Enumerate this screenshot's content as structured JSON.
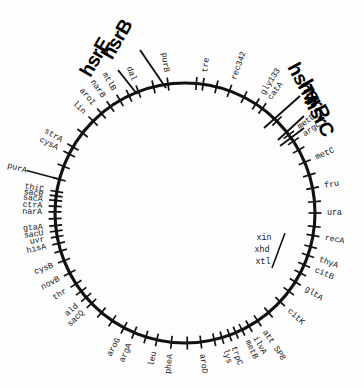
{
  "figure": {
    "type": "circular-genetic-map",
    "background_color": "#ffffff",
    "line_color": "#111111"
  },
  "circle": {
    "center_x": 185,
    "center_y": 213,
    "radius": 130
  },
  "hsr_labels": [
    {
      "id": "hsrB",
      "text": "hsrB",
      "x": 118,
      "y": 40,
      "rotate": -60,
      "leader": {
        "x1": 140,
        "y1": 50,
        "x2": 166,
        "y2": 88
      }
    },
    {
      "id": "hsrE",
      "text": "hsrE",
      "x": 96,
      "y": 58,
      "rotate": -60,
      "leader": {
        "x1": 118,
        "y1": 70,
        "x2": 137,
        "y2": 94
      }
    },
    {
      "id": "hsrM",
      "text": "hsrM",
      "x": 302,
      "y": 84,
      "rotate": 62,
      "leader": {
        "x1": 300,
        "y1": 96,
        "x2": 264,
        "y2": 128
      }
    },
    {
      "id": "hsrR",
      "text": "hsrR",
      "x": 314,
      "y": 100,
      "rotate": 62,
      "leader": {
        "x1": 304,
        "y1": 116,
        "x2": 278,
        "y2": 140
      }
    },
    {
      "id": "hsrC",
      "text": "hsrC",
      "x": 318,
      "y": 117,
      "rotate": 62,
      "leader": {
        "x1": 304,
        "y1": 128,
        "x2": 280,
        "y2": 146
      }
    }
  ],
  "inner_labels": [
    {
      "id": "xin",
      "text": "xin",
      "x": 264,
      "y": 238,
      "rotate": 0
    },
    {
      "id": "xhd",
      "text": "xhd",
      "x": 262,
      "y": 250,
      "rotate": 0
    },
    {
      "id": "xtl",
      "text": "xtl",
      "x": 263,
      "y": 262,
      "rotate": 0
    }
  ],
  "genes": [
    {
      "id": "purA",
      "label": "purA",
      "angle": 285.0,
      "tick": true,
      "leader": true,
      "label_gap": 22
    },
    {
      "id": "cysA",
      "label": "cysA",
      "angle": 297.0,
      "tick": true,
      "leader": false,
      "label_gap": 6
    },
    {
      "id": "strA",
      "label": "strA",
      "angle": 300.5,
      "tick": true,
      "leader": false,
      "label_gap": 6
    },
    {
      "id": "lin",
      "label": "lin",
      "angle": 315.0,
      "tick": true,
      "leader": false,
      "label_gap": 5
    },
    {
      "id": "aroI",
      "label": "aroI",
      "angle": 320.0,
      "tick": true,
      "leader": false,
      "label_gap": 5
    },
    {
      "id": "narB",
      "label": "narB",
      "angle": 325.0,
      "tick": true,
      "leader": false,
      "label_gap": 5
    },
    {
      "id": "mtlB",
      "label": "mtlB",
      "angle": 330.0,
      "tick": true,
      "leader": false,
      "label_gap": 5
    },
    {
      "id": "dal",
      "label": "dal",
      "angle": 339.0,
      "tick": true,
      "leader": false,
      "label_gap": 5
    },
    {
      "id": "purB",
      "label": "purB",
      "angle": 352.5,
      "tick": true,
      "leader": false,
      "label_gap": 5
    },
    {
      "id": "tre",
      "label": "tre",
      "angle": 8.0,
      "tick": true,
      "leader": false,
      "label_gap": 5
    },
    {
      "id": "rec342",
      "label": "rec342",
      "angle": 20.0,
      "tick": true,
      "leader": false,
      "label_gap": 5
    },
    {
      "id": "gly133",
      "label": "gly133",
      "angle": 33.0,
      "tick": true,
      "leader": false,
      "label_gap": 5
    },
    {
      "id": "catA",
      "label": "catA",
      "angle": 36.5,
      "tick": true,
      "leader": false,
      "label_gap": 5
    },
    {
      "id": "metD",
      "label": "metD",
      "angle": 53.0,
      "tick": true,
      "leader": false,
      "label_gap": 5
    },
    {
      "id": "argC",
      "label": "argC",
      "angle": 56.5,
      "tick": true,
      "leader": false,
      "label_gap": 5
    },
    {
      "id": "metC",
      "label": "metC",
      "angle": 67.0,
      "tick": true,
      "leader": false,
      "label_gap": 5
    },
    {
      "id": "fru",
      "label": "fru",
      "angle": 79.0,
      "tick": true,
      "leader": false,
      "label_gap": 5
    },
    {
      "id": "ura",
      "label": "ura",
      "angle": 90.0,
      "tick": true,
      "leader": false,
      "label_gap": 5
    },
    {
      "id": "recA",
      "label": "recA",
      "angle": 100.0,
      "tick": true,
      "leader": false,
      "label_gap": 5
    },
    {
      "id": "thyA",
      "label": "thyA",
      "angle": 109.0,
      "tick": true,
      "leader": false,
      "label_gap": 5
    },
    {
      "id": "citB",
      "label": "citB",
      "angle": 113.5,
      "tick": true,
      "leader": false,
      "label_gap": 5
    },
    {
      "id": "gltA",
      "label": "gltA",
      "angle": 122.0,
      "tick": true,
      "leader": false,
      "label_gap": 5
    },
    {
      "id": "citK",
      "label": "citK",
      "angle": 133.0,
      "tick": true,
      "leader": false,
      "label_gap": 5
    },
    {
      "id": "attSP8",
      "label": "att SP8",
      "angle": 146.0,
      "tick": true,
      "leader": false,
      "label_gap": 5
    },
    {
      "id": "ilvA",
      "label": "ilvA",
      "angle": 150.5,
      "tick": true,
      "leader": false,
      "label_gap": 5
    },
    {
      "id": "metB",
      "label": "metB",
      "angle": 154.0,
      "tick": true,
      "leader": false,
      "label_gap": 5
    },
    {
      "id": "trpC",
      "label": "trpC",
      "angle": 160.0,
      "tick": true,
      "leader": false,
      "label_gap": 5
    },
    {
      "id": "lys",
      "label": "lys",
      "angle": 163.5,
      "tick": true,
      "leader": false,
      "label_gap": 5
    },
    {
      "id": "aroD",
      "label": "aroD",
      "angle": 173.0,
      "tick": true,
      "leader": false,
      "label_gap": 5
    },
    {
      "id": "pheA",
      "label": "pheA",
      "angle": 186.0,
      "tick": true,
      "leader": false,
      "label_gap": 5
    },
    {
      "id": "leu",
      "label": "leu",
      "angle": 192.5,
      "tick": true,
      "leader": false,
      "label_gap": 5
    },
    {
      "id": "argA",
      "label": "argA",
      "angle": 203.0,
      "tick": true,
      "leader": false,
      "label_gap": 5
    },
    {
      "id": "aroG",
      "label": "aroG",
      "angle": 208.0,
      "tick": true,
      "leader": false,
      "label_gap": 5
    },
    {
      "id": "sacQ",
      "label": "sacQ",
      "angle": 226.0,
      "tick": true,
      "leader": false,
      "label_gap": 5
    },
    {
      "id": "ald",
      "label": "ald",
      "angle": 229.5,
      "tick": true,
      "leader": false,
      "label_gap": 5
    },
    {
      "id": "thr",
      "label": "thr",
      "angle": 237.0,
      "tick": true,
      "leader": false,
      "label_gap": 5
    },
    {
      "id": "novB",
      "label": "novB",
      "angle": 242.5,
      "tick": true,
      "leader": false,
      "label_gap": 5
    },
    {
      "id": "cysB",
      "label": "cysB",
      "angle": 248.5,
      "tick": true,
      "leader": false,
      "label_gap": 5
    },
    {
      "id": "hisA",
      "label": "hisA",
      "angle": 256.5,
      "tick": true,
      "leader": false,
      "label_gap": 6
    },
    {
      "id": "uvr",
      "label": "uvr",
      "angle": 259.5,
      "tick": true,
      "leader": false,
      "label_gap": 6
    },
    {
      "id": "sacU",
      "label": "sacU",
      "angle": 262.0,
      "tick": true,
      "leader": false,
      "label_gap": 6
    },
    {
      "id": "gtaA",
      "label": "gtaA",
      "angle": 264.5,
      "tick": true,
      "leader": false,
      "label_gap": 6
    },
    {
      "id": "narA",
      "label": "narA",
      "angle": 270.5,
      "tick": true,
      "leader": false,
      "label_gap": 6
    },
    {
      "id": "ctrA",
      "label": "ctrA",
      "angle": 273.0,
      "tick": true,
      "leader": false,
      "label_gap": 6
    },
    {
      "id": "sacA",
      "label": "sacA",
      "angle": 275.5,
      "tick": true,
      "leader": false,
      "label_gap": 6
    },
    {
      "id": "sacR",
      "label": "sacR",
      "angle": 277.5,
      "tick": true,
      "leader": false,
      "label_gap": 6
    },
    {
      "id": "thiC",
      "label": "thiC",
      "angle": 279.5,
      "tick": true,
      "leader": false,
      "label_gap": 6
    }
  ],
  "extra_ticks": [
    {
      "angle": 5.0
    },
    {
      "angle": 14.0
    },
    {
      "angle": 27.0
    },
    {
      "angle": 45.0
    },
    {
      "angle": 61.0
    },
    {
      "angle": 73.0
    },
    {
      "angle": 85.0
    },
    {
      "angle": 96.0
    },
    {
      "angle": 105.0
    },
    {
      "angle": 117.5
    },
    {
      "angle": 127.0
    },
    {
      "angle": 140.0
    },
    {
      "angle": 157.0
    },
    {
      "angle": 167.0
    },
    {
      "angle": 179.0
    },
    {
      "angle": 197.5
    },
    {
      "angle": 214.0
    },
    {
      "angle": 220.0
    },
    {
      "angle": 233.0
    },
    {
      "angle": 253.0
    },
    {
      "angle": 267.5
    },
    {
      "angle": 291.0
    },
    {
      "angle": 308.0
    },
    {
      "angle": 334.5
    },
    {
      "angle": 346.0
    }
  ]
}
